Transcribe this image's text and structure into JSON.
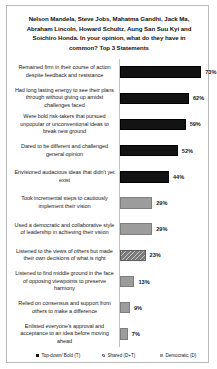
{
  "chart_data": {
    "type": "bar",
    "orientation": "horizontal",
    "title": "Nelson Mandela, Steve Jobs, Mahatma Gandhi, Jack Ma, Abraham Lincoln, Howard Schultz, Aung San Suu Kyi and Soichiro Honda. In your opinion, what do they have in common? Top 3 Statements",
    "xlabel": "",
    "ylabel": "",
    "xlim": [
      0,
      80
    ],
    "grid": false,
    "legend_position": "bottom",
    "categories": [
      "Remained firm in their course of action despite feedback and resistance",
      "Had long lasting energy to see their plans through without giving up amidst challenges faced",
      "Were bold risk-takers that pursued unpopular or unconventional ideas to break new ground",
      "Dared to be different and challenged general opinion",
      "Envisioned audacious  ideas that didn't yet exist",
      "Took incremental steps to cautiously implement their vision",
      "Used a democratic and collaborative style of leadership  in achieving their vision",
      "Listened to the views of others but made their own decisions of what is right",
      "Listened to find middle ground in the face of opposing viewpoints  to preserve harmony",
      "Relied on consensus and support from others to make a difference",
      "Enlisted everyone's approval and acceptance to an idea before moving ahead"
    ],
    "values": [
      73,
      62,
      59,
      52,
      44,
      29,
      29,
      23,
      13,
      9,
      7
    ],
    "value_labels": [
      "73%",
      "62%",
      "59%",
      "52%",
      "44%",
      "29%",
      "29%",
      "23%",
      "13%",
      "9%",
      "7%"
    ],
    "series_assignment": [
      "topdown",
      "topdown",
      "topdown",
      "topdown",
      "topdown",
      "democratic",
      "democratic",
      "shared",
      "democratic",
      "democratic",
      "democratic"
    ],
    "legend": [
      {
        "key": "topdown",
        "label": "Top-down/ Bold (T)",
        "color": "#131313"
      },
      {
        "key": "shared",
        "label": "Shared (D+T)",
        "color": "#7b7b7b"
      },
      {
        "key": "democratic",
        "label": "Democratic (D)",
        "color": "#9c9c9c"
      }
    ]
  }
}
